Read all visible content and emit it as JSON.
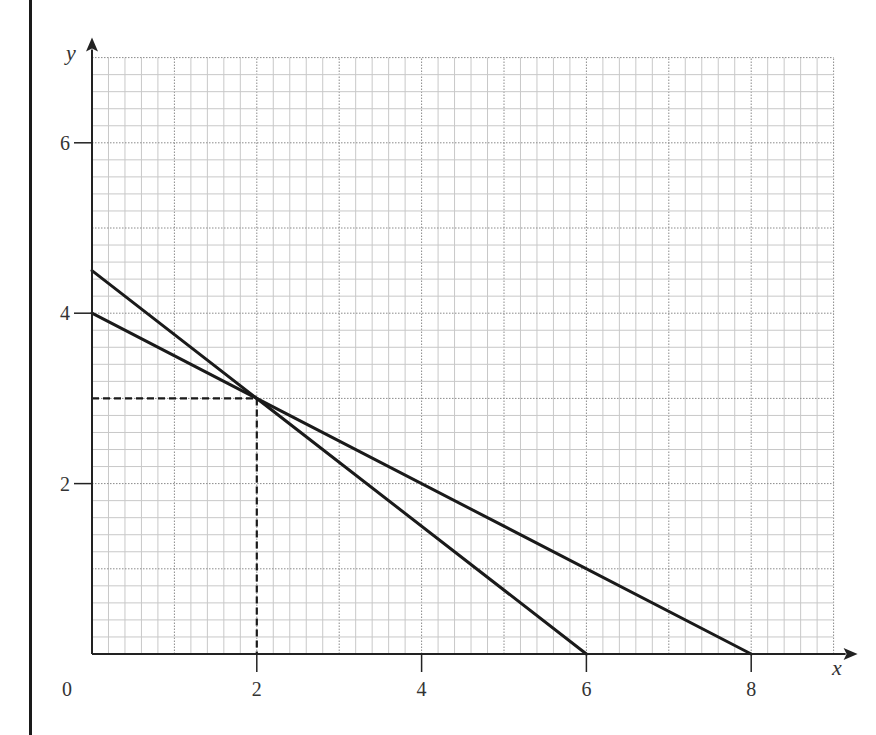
{
  "chart_data": {
    "type": "line",
    "title": "",
    "xlabel": "x",
    "ylabel": "y",
    "xlim": [
      0,
      9
    ],
    "ylim": [
      0,
      7
    ],
    "grid": {
      "on": true,
      "minor_step": 0.2,
      "major_step": 1
    },
    "x_ticks": [
      2,
      4,
      6,
      8
    ],
    "y_ticks": [
      2,
      4,
      6
    ],
    "origin_label": "0",
    "series": [
      {
        "name": "line-1",
        "points": [
          [
            0,
            4.5
          ],
          [
            6,
            0
          ]
        ],
        "style": "solid"
      },
      {
        "name": "line-2",
        "points": [
          [
            0,
            4
          ],
          [
            8,
            0
          ]
        ],
        "style": "solid"
      }
    ],
    "annotations": [
      {
        "type": "dashed-guide",
        "point": [
          2,
          3
        ],
        "description": "intersection point projected to both axes"
      }
    ],
    "legend": null
  },
  "labels": {
    "x_axis": "x",
    "y_axis": "y",
    "origin": "0",
    "x_ticks": [
      "2",
      "4",
      "6",
      "8"
    ],
    "y_ticks": [
      "2",
      "4",
      "6"
    ]
  },
  "colors": {
    "line": "#1a1a1a",
    "grid_minor": "#c8c8c8",
    "grid_major": "#8a8a8a",
    "axis": "#222222"
  }
}
